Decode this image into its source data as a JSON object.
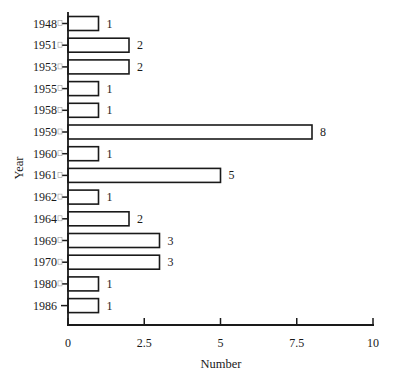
{
  "chart_data": {
    "type": "bar",
    "orientation": "horizontal",
    "title": "",
    "xlabel": "Number",
    "ylabel": "Year",
    "categories": [
      "1948",
      "1951",
      "1953",
      "1955",
      "1958",
      "1959",
      "1960",
      "1961",
      "1962",
      "1964",
      "1969",
      "1970",
      "1980",
      "1986"
    ],
    "values": [
      1,
      2,
      2,
      1,
      1,
      8,
      1,
      5,
      1,
      2,
      3,
      3,
      1,
      1
    ],
    "data_labels": [
      "1",
      "2",
      "2",
      "1",
      "1",
      "8",
      "1",
      "5",
      "1",
      "2",
      "3",
      "3",
      "1",
      "1"
    ],
    "xlim": [
      0,
      10
    ],
    "xticks": [
      0,
      2.5,
      5,
      7.5,
      10
    ],
    "xtick_labels": [
      "0",
      "2.5",
      "5",
      "7.5",
      "10"
    ],
    "grid": false,
    "legend": null,
    "bar_fill": "#ffffff",
    "bar_stroke": "#1a1a1a"
  }
}
